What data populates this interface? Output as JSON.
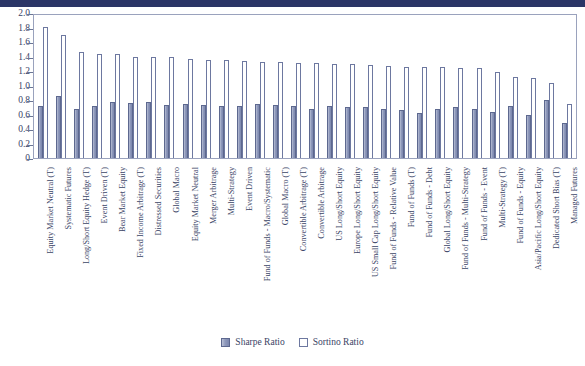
{
  "chart_data": {
    "type": "bar",
    "title": "",
    "xlabel": "",
    "ylabel": "",
    "ylim": [
      0,
      2.0
    ],
    "yticks": [
      "2.0",
      "1.8",
      "1.6",
      "1.4",
      "1.2",
      "1.0",
      "0.8",
      "0.6",
      "0.4",
      "0.2",
      "0"
    ],
    "grid": false,
    "legend_position": "bottom-center",
    "categories": [
      "Equity Market Neutral (T)",
      "Systematic Futures",
      "Long/Short Equity Hedge (T)",
      "Event Driven (T)",
      "Bear Market Equity",
      "Fixed Income Arbitrage (T)",
      "Distressed Securities",
      "Global Macro",
      "Equity Market Neutral",
      "Merger Arbitrage",
      "Multi-Strategy",
      "Event Driven",
      "Fund of Funds - Macro/Systematic",
      "Global Macro (T)",
      "Convertible Arbitrage (T)",
      "Convertible Arbitrage",
      "US Long/Short Equity",
      "Europe Long/Short Equity",
      "US Small Cap Long/Short Equity",
      "Fund of Funds - Relative Value",
      "Fund of Funds (T)",
      "Fund of Funds - Debt",
      "Global Long/Short Equity",
      "Fund of Funds - Multi-Strategy",
      "Fund of Funds - Event",
      "Multi-Strategy (T)",
      "Fund of Funds - Equity",
      "Asia/Pacific Long/Short Equity",
      "Dedicated Short Bias (T)",
      "Managed Futures"
    ],
    "series": [
      {
        "name": "Sharpe Ratio",
        "color": "#8f99bb",
        "values": [
          0.72,
          0.85,
          0.67,
          0.72,
          0.77,
          0.76,
          0.77,
          0.73,
          0.74,
          0.73,
          0.72,
          0.72,
          0.74,
          0.73,
          0.72,
          0.68,
          0.72,
          0.7,
          0.71,
          0.68,
          0.66,
          0.62,
          0.68,
          0.7,
          0.67,
          0.64,
          0.72,
          0.6,
          0.8,
          0.48
        ]
      },
      {
        "name": "Sortino Ratio",
        "color": "#ffffff",
        "values": [
          1.81,
          1.69,
          1.46,
          1.44,
          1.43,
          1.4,
          1.4,
          1.39,
          1.36,
          1.35,
          1.35,
          1.34,
          1.33,
          1.32,
          1.31,
          1.31,
          1.3,
          1.29,
          1.28,
          1.27,
          1.26,
          1.25,
          1.25,
          1.24,
          1.24,
          1.19,
          1.12,
          1.1,
          1.04,
          0.75
        ]
      }
    ],
    "legend": [
      "Sharpe Ratio",
      "Sortino Ratio"
    ]
  }
}
